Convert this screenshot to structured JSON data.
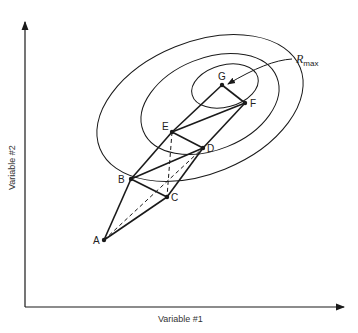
{
  "diagram": {
    "type": "simplex-optimization-contour",
    "axes": {
      "x_label": "Variable #1",
      "y_label": "Variable #2"
    },
    "contour_label": {
      "symbol": "R",
      "subscript": "max"
    },
    "points": [
      {
        "id": "A",
        "label": "A",
        "x": 104,
        "y": 240
      },
      {
        "id": "B",
        "label": "B",
        "x": 131,
        "y": 179
      },
      {
        "id": "C",
        "label": "C",
        "x": 167,
        "y": 197
      },
      {
        "id": "D",
        "label": "D",
        "x": 203,
        "y": 148
      },
      {
        "id": "E",
        "label": "E",
        "x": 172,
        "y": 132
      },
      {
        "id": "F",
        "label": "F",
        "x": 245,
        "y": 103
      },
      {
        "id": "G",
        "label": "G",
        "x": 222,
        "y": 85
      }
    ],
    "contours": [
      "outer",
      "middle",
      "inner"
    ],
    "colors": {
      "line": "#1a1a1a",
      "background": "#ffffff"
    }
  }
}
